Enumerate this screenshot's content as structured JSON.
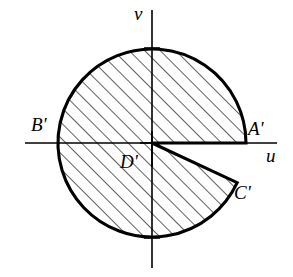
{
  "figure": {
    "background_color": "#ffffff",
    "stroke_color": "#000000",
    "hatch_color": "#000000",
    "width": 293,
    "height": 277
  },
  "axes": {
    "horizontal": {
      "label": "u",
      "y": 143,
      "x_start": 25,
      "x_end": 277,
      "label_x": 266,
      "label_y": 146
    },
    "vertical": {
      "label": "v",
      "x": 152,
      "y_start": 10,
      "y_end": 268,
      "label_x": 134,
      "label_y": 4
    }
  },
  "region": {
    "shape": "circle-with-wedge-removed",
    "center": {
      "x": 152,
      "y": 143,
      "label": "D'"
    },
    "radius": 94,
    "wedge": {
      "start_angle_deg": 0,
      "end_angle_deg": -25,
      "description": "sector cut out between positive u-axis and ray to C'"
    },
    "hatch": {
      "angle_deg": 45,
      "spacing_px": 11,
      "stroke_width": 1.2
    }
  },
  "points": [
    {
      "id": "A",
      "label": "A'",
      "x": 246,
      "y": 143,
      "label_x": 248,
      "label_y": 119
    },
    {
      "id": "B",
      "label": "B'",
      "x": 58,
      "y": 143,
      "label_x": 31,
      "label_y": 115
    },
    {
      "id": "C",
      "label": "C'",
      "x": 237,
      "y": 183,
      "label_x": 234,
      "label_y": 183
    },
    {
      "id": "D",
      "label": "D'",
      "x": 152,
      "y": 143,
      "label_x": 120,
      "label_y": 152
    }
  ]
}
